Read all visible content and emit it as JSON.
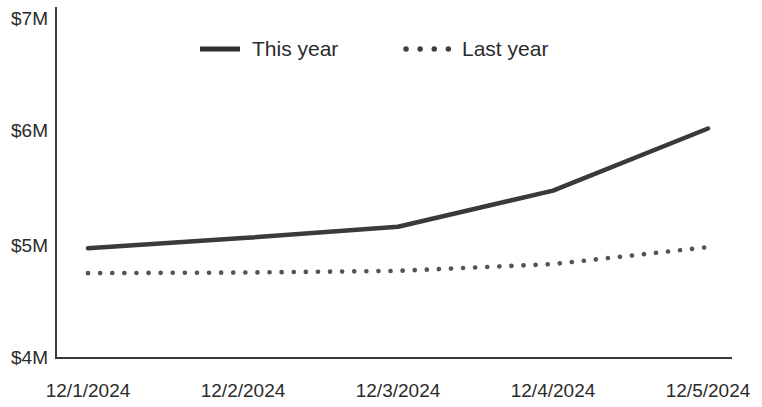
{
  "chart_data": {
    "type": "line",
    "title": "",
    "subtitle": "",
    "xlabel": "",
    "ylabel": "",
    "categories": [
      "12/1/2024",
      "12/2/2024",
      "12/3/2024",
      "12/4/2024",
      "12/5/2024"
    ],
    "x_tick_labels": [
      "12/1/2024",
      "12/2/2024",
      "12/3/2024",
      "12/4/2024",
      "12/5/2024"
    ],
    "y_tick_labels": [
      "$7M",
      "$6M",
      "$5M",
      "$4M"
    ],
    "y_tick_values": [
      7000000,
      6000000,
      5000000,
      4000000
    ],
    "ylim": [
      4000000,
      7000000
    ],
    "grid": false,
    "legend_position": "top-center",
    "series": [
      {
        "name": "This year",
        "style": "solid",
        "color": "#3a3a3a",
        "values": [
          4980000,
          5070000,
          5170000,
          5490000,
          6040000
        ]
      },
      {
        "name": "Last year",
        "style": "dotted",
        "color": "#545454",
        "values": [
          4760000,
          4765000,
          4780000,
          4840000,
          4990000
        ]
      }
    ]
  },
  "legend": {
    "items": [
      {
        "label": "This year",
        "style": "solid"
      },
      {
        "label": "Last year",
        "style": "dotted"
      }
    ]
  },
  "axes": {
    "y_labels": [
      "$7M",
      "$6M",
      "$5M",
      "$4M"
    ],
    "x_labels": [
      "12/1/2024",
      "12/2/2024",
      "12/3/2024",
      "12/4/2024",
      "12/5/2024"
    ]
  },
  "colors": {
    "axis": "#3a3a3a",
    "this_year": "#3a3a3a",
    "last_year": "#545454",
    "text": "#2b2b2b",
    "background": "#ffffff"
  }
}
